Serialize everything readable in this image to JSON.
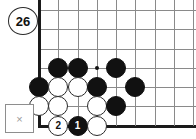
{
  "diagram": {
    "type": "go-board-problem",
    "move_label": "26",
    "x_marker": "×",
    "board": {
      "background": "#ffffff",
      "line_color": "#8a8a8a",
      "edge_color": "#1a1a1a",
      "origin_x": 39,
      "origin_y": 10,
      "spacing": 19.25,
      "columns": 9,
      "rows": 7,
      "left_edge_is_border": true,
      "bottom_edge_is_border": true,
      "star_points": [
        {
          "col": 3,
          "row": 3
        }
      ]
    },
    "stones": [
      {
        "col": 1,
        "row": 3,
        "color": "black",
        "label": ""
      },
      {
        "col": 2,
        "row": 3,
        "color": "black",
        "label": ""
      },
      {
        "col": 4,
        "row": 3,
        "color": "black",
        "label": ""
      },
      {
        "col": 0,
        "row": 4,
        "color": "black",
        "label": ""
      },
      {
        "col": 1,
        "row": 4,
        "color": "white",
        "label": ""
      },
      {
        "col": 2,
        "row": 4,
        "color": "white",
        "label": ""
      },
      {
        "col": 3,
        "row": 4,
        "color": "black",
        "label": ""
      },
      {
        "col": 5,
        "row": 4,
        "color": "black",
        "label": ""
      },
      {
        "col": 0,
        "row": 5,
        "color": "white",
        "label": ""
      },
      {
        "col": 1,
        "row": 5,
        "color": "white",
        "label": ""
      },
      {
        "col": 3,
        "row": 5,
        "color": "white",
        "label": ""
      },
      {
        "col": 4,
        "row": 5,
        "color": "black",
        "label": ""
      },
      {
        "col": 1,
        "row": 6,
        "color": "white",
        "label": "2"
      },
      {
        "col": 2,
        "row": 6,
        "color": "black",
        "label": "1"
      },
      {
        "col": 3,
        "row": 6,
        "color": "white",
        "label": ""
      }
    ],
    "colors": {
      "black_stone": "#111111",
      "white_stone": "#ffffff",
      "white_stone_border": "#2a2a2a",
      "grid": "#8a8a8a",
      "border": "#1a1a1a",
      "x_marker": "#9a9a9a"
    }
  }
}
